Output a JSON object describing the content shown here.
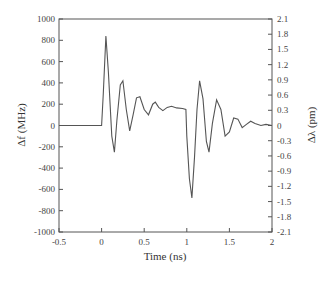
{
  "chart_data": {
    "type": "line",
    "title": "",
    "xlabel": "Time (ns)",
    "ylabel": "Δf (MHz)",
    "ylabel_right": "Δλ (pm)",
    "xlim": [
      -0.5,
      2
    ],
    "ylim": [
      -1000,
      1000
    ],
    "ylim_right": [
      -2.1,
      2.1
    ],
    "grid": false,
    "legend": null,
    "x_ticks": [
      "-0.5",
      "0",
      "0.5",
      "1",
      "1.5",
      "2"
    ],
    "y_ticks": [
      "1000",
      "800",
      "600",
      "400",
      "200",
      "0",
      "-200",
      "-400",
      "-600",
      "-800",
      "-1000"
    ],
    "y_ticks_right": [
      "2.1",
      "1.8",
      "1.5",
      "1.2",
      "0.9",
      "0.6",
      "0.3",
      "0",
      "-0.3",
      "-0.6",
      "-0.9",
      "-1.2",
      "-1.5",
      "-1.8",
      "-2.1"
    ],
    "series": [
      {
        "name": "frequency chirp",
        "color": "#555555",
        "x": [
          -0.5,
          0.0,
          0.02,
          0.05,
          0.08,
          0.12,
          0.15,
          0.18,
          0.22,
          0.25,
          0.29,
          0.33,
          0.37,
          0.41,
          0.45,
          0.5,
          0.55,
          0.6,
          0.63,
          0.67,
          0.72,
          0.77,
          0.82,
          0.88,
          0.95,
          0.99,
          1.0,
          1.03,
          1.06,
          1.09,
          1.12,
          1.15,
          1.19,
          1.23,
          1.26,
          1.3,
          1.35,
          1.4,
          1.45,
          1.5,
          1.55,
          1.6,
          1.65,
          1.7,
          1.75,
          1.8,
          1.87,
          1.93,
          2.0
        ],
        "y": [
          0,
          0,
          300,
          840,
          500,
          -100,
          -250,
          50,
          380,
          420,
          150,
          -50,
          100,
          260,
          270,
          150,
          100,
          200,
          220,
          170,
          140,
          170,
          180,
          165,
          160,
          150,
          -100,
          -500,
          -680,
          -300,
          150,
          420,
          250,
          -150,
          -250,
          20,
          240,
          150,
          -100,
          -60,
          70,
          60,
          -20,
          10,
          40,
          20,
          0,
          10,
          0
        ]
      }
    ]
  }
}
